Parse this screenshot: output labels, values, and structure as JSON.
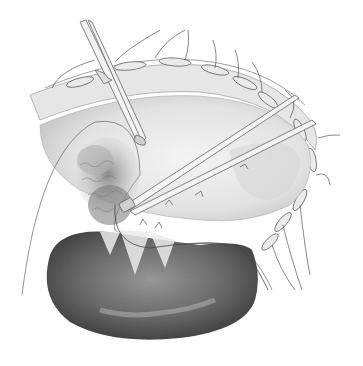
{
  "image": {
    "description": "Surgical pencil illustration: open abdominal incision with retracted edges and sutures, forceps and scissors grasping tissue, darkly shaded kidney-shaped organ below",
    "style": "grayscale pencil drawing",
    "colors": {
      "background": "#ffffff",
      "line": "#555555",
      "organ_dark": "#4a4a4a",
      "organ_mid": "#7a7a7a",
      "tissue_light": "#d8d8d8",
      "tissue_mid": "#a8a8a8"
    },
    "elements": [
      "incision-edge-with-sutures",
      "scissors-instrument",
      "forceps-instrument",
      "textured-tissue-mass",
      "kidney-shaped-organ",
      "suture-thread"
    ]
  }
}
